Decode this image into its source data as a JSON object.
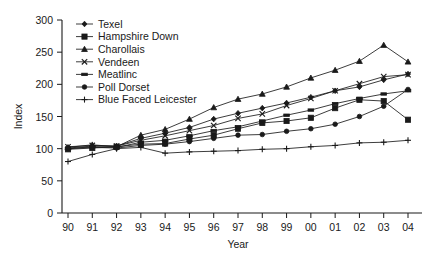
{
  "chart_data": {
    "type": "line",
    "title": "",
    "xlabel": "Year",
    "ylabel": "Index",
    "x": [
      "90",
      "91",
      "92",
      "93",
      "94",
      "95",
      "96",
      "97",
      "98",
      "99",
      "00",
      "01",
      "02",
      "03",
      "04"
    ],
    "x_numeric": [
      1990,
      1991,
      1992,
      1993,
      1994,
      1995,
      1996,
      1997,
      1998,
      1999,
      2000,
      2001,
      2002,
      2003,
      2004
    ],
    "ylim": [
      0,
      300
    ],
    "y_ticks": [
      0,
      50,
      100,
      150,
      200,
      250,
      300
    ],
    "xlim_labels": [
      "90",
      "04"
    ],
    "grid": false,
    "legend_position": "top-left-inside",
    "series": [
      {
        "name": "Texel",
        "marker": "diamond",
        "values": [
          101,
          104,
          104,
          116,
          124,
          133,
          146,
          155,
          163,
          171,
          180,
          190,
          196,
          207,
          216
        ]
      },
      {
        "name": "Hampshire Down",
        "marker": "square-filled",
        "values": [
          99,
          101,
          103,
          107,
          108,
          115,
          121,
          131,
          140,
          143,
          148,
          163,
          176,
          174,
          145
        ]
      },
      {
        "name": "Charollais",
        "marker": "triangle",
        "values": [
          102,
          106,
          103,
          121,
          130,
          146,
          164,
          177,
          185,
          196,
          210,
          222,
          236,
          261,
          235
        ]
      },
      {
        "name": "Vendeen",
        "marker": "cross",
        "values": [
          103,
          105,
          104,
          113,
          120,
          128,
          136,
          147,
          154,
          167,
          178,
          190,
          201,
          212,
          215
        ]
      },
      {
        "name": "Meatlinc",
        "marker": "bar",
        "values": [
          100,
          103,
          102,
          110,
          113,
          120,
          128,
          134,
          143,
          152,
          160,
          170,
          178,
          185,
          190
        ]
      },
      {
        "name": "Poll Dorset",
        "marker": "circle-filled",
        "values": [
          100,
          102,
          101,
          105,
          107,
          111,
          116,
          121,
          122,
          127,
          131,
          138,
          150,
          166,
          192
        ]
      },
      {
        "name": "Blue Faced Leicester",
        "marker": "plus",
        "values": [
          80,
          91,
          100,
          102,
          93,
          95,
          96,
          97,
          99,
          100,
          103,
          105,
          109,
          110,
          113
        ]
      }
    ]
  },
  "axes": {
    "y_title": "Index",
    "x_title": "Year"
  }
}
